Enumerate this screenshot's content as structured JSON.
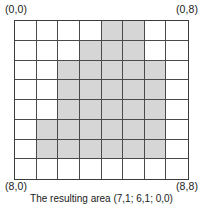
{
  "figure": {
    "name": "shaded-grid-figure",
    "labels": {
      "top_left": "(0,0)",
      "top_right": "(0,8)",
      "bottom_left": "(8,0)",
      "bottom_right": "(8,8)"
    },
    "caption": "The resulting area (7,1; 6,1; 0,0)",
    "colors": {
      "shaded": "#d6d6d6",
      "empty": "#ffffff",
      "grid_line": "#4a4a4a",
      "border": "#3c3c3c",
      "text": "#1a1a1a"
    }
  },
  "chart_data": {
    "type": "heatmap",
    "title": "",
    "xlabel": "",
    "ylabel": "",
    "rows": 8,
    "cols": 8,
    "row_labels": [
      "0",
      "1",
      "2",
      "3",
      "4",
      "5",
      "6",
      "7"
    ],
    "col_labels": [
      "0",
      "1",
      "2",
      "3",
      "4",
      "5",
      "6",
      "7"
    ],
    "corner_annotations": {
      "top_left": "(0,0)",
      "top_right": "(0,8)",
      "bottom_left": "(8,0)",
      "bottom_right": "(8,8)"
    },
    "legend": [
      {
        "label": "shaded",
        "value": 1,
        "color": "#d6d6d6"
      },
      {
        "label": "empty",
        "value": 0,
        "color": "#ffffff"
      }
    ],
    "values": [
      [
        0,
        0,
        0,
        0,
        1,
        1,
        0,
        0
      ],
      [
        0,
        0,
        0,
        1,
        1,
        1,
        0,
        0
      ],
      [
        0,
        0,
        1,
        1,
        1,
        1,
        1,
        0
      ],
      [
        0,
        0,
        1,
        1,
        1,
        1,
        1,
        0
      ],
      [
        0,
        0,
        1,
        1,
        1,
        1,
        1,
        0
      ],
      [
        0,
        1,
        1,
        1,
        1,
        1,
        1,
        0
      ],
      [
        0,
        1,
        1,
        1,
        1,
        1,
        1,
        0
      ],
      [
        0,
        0,
        0,
        0,
        0,
        0,
        0,
        0
      ]
    ],
    "shaded_count": 31,
    "grid": true
  }
}
